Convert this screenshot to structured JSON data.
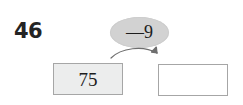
{
  "problem": {
    "number": "46",
    "start_value": "75",
    "operation": "—9",
    "result_value": "",
    "arrow": "curved-arrow-right"
  },
  "colors": {
    "bubble_fill": "#d2d2d2",
    "box_border": "#a6a6a6",
    "start_box_fill": "#eceded",
    "result_box_fill": "#ffffff",
    "text": "#1d1d1d",
    "arrow": "#6e6e6e"
  }
}
